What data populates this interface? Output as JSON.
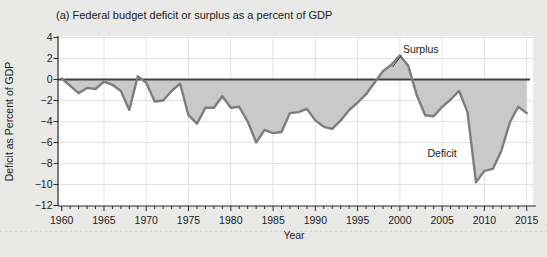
{
  "chart": {
    "title": "(a) Federal budget deficit or surplus as a percent of GDP",
    "xlabel": "Year",
    "ylabel": "Deficit as Percent of GDP",
    "annotations": {
      "surplus": "Surplus",
      "deficit": "Deficit"
    }
  },
  "chart_data": {
    "type": "area",
    "title": "(a) Federal budget deficit or surplus as a percent of GDP",
    "xlabel": "Year",
    "ylabel": "Deficit as Percent of GDP",
    "x": [
      1960,
      1961,
      1962,
      1963,
      1964,
      1965,
      1966,
      1967,
      1968,
      1969,
      1970,
      1971,
      1972,
      1973,
      1974,
      1975,
      1976,
      1977,
      1978,
      1979,
      1980,
      1981,
      1982,
      1983,
      1984,
      1985,
      1986,
      1987,
      1988,
      1989,
      1990,
      1991,
      1992,
      1993,
      1994,
      1995,
      1996,
      1997,
      1998,
      1999,
      2000,
      2001,
      2002,
      2003,
      2004,
      2005,
      2006,
      2007,
      2008,
      2009,
      2010,
      2011,
      2012,
      2013,
      2014,
      2015
    ],
    "values": [
      0.1,
      -0.6,
      -1.3,
      -0.8,
      -0.9,
      -0.2,
      -0.5,
      -1.1,
      -2.9,
      0.3,
      -0.3,
      -2.1,
      -2.0,
      -1.1,
      -0.4,
      -3.4,
      -4.2,
      -2.7,
      -2.7,
      -1.6,
      -2.7,
      -2.6,
      -4.0,
      -6.0,
      -4.8,
      -5.1,
      -5.0,
      -3.2,
      -3.1,
      -2.8,
      -3.9,
      -4.5,
      -4.7,
      -3.9,
      -2.9,
      -2.2,
      -1.4,
      -0.3,
      0.8,
      1.4,
      2.3,
      1.3,
      -1.5,
      -3.4,
      -3.5,
      -2.6,
      -1.9,
      -1.1,
      -3.1,
      -9.8,
      -8.7,
      -8.5,
      -6.8,
      -4.1,
      -2.6,
      -3.2
    ],
    "xlim": [
      1960,
      2015
    ],
    "ylim": [
      -12,
      4
    ],
    "x_ticks": [
      1960,
      1965,
      1970,
      1975,
      1980,
      1985,
      1990,
      1995,
      2000,
      2005,
      2010,
      2015
    ],
    "x_tick_labels": [
      "1960",
      "1965",
      "1970",
      "1975",
      "1980",
      "1985",
      "1990",
      "1995",
      "2000",
      "2005",
      "2010",
      "2015"
    ],
    "x_minor_tick_step": 1,
    "y_ticks": [
      4,
      2,
      0,
      -2,
      -4,
      -6,
      -8,
      -10,
      -12
    ],
    "y_tick_labels": [
      "4",
      "2",
      "0",
      "−2",
      "−4",
      "−6",
      "−8",
      "−10",
      "−12"
    ],
    "grid": true,
    "zero_line": true,
    "legend": "none",
    "annotations": [
      {
        "text": "Surplus",
        "year": 2000,
        "value": 2.3
      },
      {
        "text": "Deficit",
        "year": 2008,
        "value": -6.5
      }
    ],
    "colors": {
      "background": "#e9e9e8",
      "plot_background": "#ffffff",
      "grid": "#e2e2e2",
      "area_fill": "#c9c9c9",
      "line": "#7d7d7d",
      "zero_line": "#404040",
      "axis": "#2a2a2a",
      "text": "#1b1b1b"
    }
  }
}
